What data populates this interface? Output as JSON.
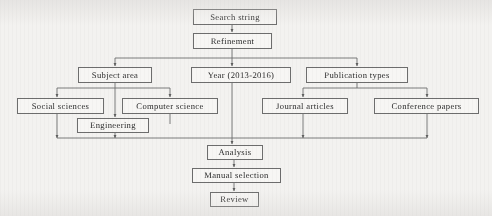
{
  "diagram": {
    "type": "flowchart",
    "line_color": "#6d6d6d",
    "text_color": "#2b2b2b",
    "background_color": "#f3f2f0",
    "box_fill": "#f7f6f4"
  },
  "nodes": {
    "search_string": {
      "label": "Search string",
      "x": 193,
      "y": 9,
      "w": 84,
      "h": 16
    },
    "refinement": {
      "label": "Refinement",
      "x": 193,
      "y": 33,
      "w": 79,
      "h": 16
    },
    "subject_area": {
      "label": "Subject area",
      "x": 78,
      "y": 67,
      "w": 74,
      "h": 16
    },
    "year_range": {
      "label": "Year (2013-2016)",
      "x": 191,
      "y": 67,
      "w": 100,
      "h": 16
    },
    "publication_types": {
      "label": "Publication types",
      "x": 306,
      "y": 67,
      "w": 102,
      "h": 16
    },
    "social_sciences": {
      "label": "Social sciences",
      "x": 17,
      "y": 98,
      "w": 87,
      "h": 16
    },
    "computer_science": {
      "label": "Computer science",
      "x": 122,
      "y": 98,
      "w": 96,
      "h": 16
    },
    "journal_articles": {
      "label": "Journal articles",
      "x": 262,
      "y": 98,
      "w": 86,
      "h": 16
    },
    "conference_papers": {
      "label": "Conference papers",
      "x": 374,
      "y": 98,
      "w": 105,
      "h": 16
    },
    "engineering": {
      "label": "Engineering",
      "x": 77,
      "y": 118,
      "w": 72,
      "h": 15
    },
    "analysis": {
      "label": "Analysis",
      "x": 207,
      "y": 145,
      "w": 56,
      "h": 15
    },
    "manual_selection": {
      "label": "Manual selection",
      "x": 192,
      "y": 168,
      "w": 89,
      "h": 15
    },
    "review": {
      "label": "Review",
      "x": 210,
      "y": 192,
      "w": 49,
      "h": 15
    }
  },
  "edges": [
    {
      "from": "search_string",
      "to": "refinement"
    },
    {
      "from": "refinement",
      "to": "subject_area"
    },
    {
      "from": "refinement",
      "to": "year_range"
    },
    {
      "from": "refinement",
      "to": "publication_types"
    },
    {
      "from": "subject_area",
      "to": "social_sciences"
    },
    {
      "from": "subject_area",
      "to": "computer_science"
    },
    {
      "from": "subject_area",
      "to": "engineering"
    },
    {
      "from": "publication_types",
      "to": "journal_articles"
    },
    {
      "from": "publication_types",
      "to": "conference_papers"
    },
    {
      "from": "social_sciences",
      "to": "analysis"
    },
    {
      "from": "computer_science",
      "to": "analysis"
    },
    {
      "from": "engineering",
      "to": "analysis"
    },
    {
      "from": "year_range",
      "to": "analysis"
    },
    {
      "from": "journal_articles",
      "to": "analysis"
    },
    {
      "from": "conference_papers",
      "to": "analysis"
    },
    {
      "from": "analysis",
      "to": "manual_selection"
    },
    {
      "from": "manual_selection",
      "to": "review"
    }
  ]
}
